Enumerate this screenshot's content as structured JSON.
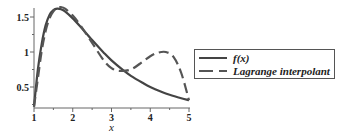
{
  "chart_data": {
    "type": "line",
    "title": "",
    "xlabel": "x",
    "ylabel": "",
    "xlim": [
      1,
      5
    ],
    "ylim": [
      0.21,
      1.7
    ],
    "xticks": [
      1,
      2,
      3,
      4,
      5
    ],
    "xtick_labels": [
      "1",
      "2",
      "3",
      "4",
      "5"
    ],
    "yticks": [
      0.5,
      1,
      1.5
    ],
    "ytick_labels": [
      "0.5",
      "1",
      "1.5"
    ],
    "grid": false,
    "legend_position": "right",
    "series": [
      {
        "name": "f(x)",
        "style": "solid",
        "color": "#444444",
        "x": [
          1.0,
          1.1,
          1.2,
          1.3,
          1.4,
          1.5,
          1.6,
          1.7,
          1.8,
          2.0,
          2.2,
          2.5,
          2.8,
          3.0,
          3.3,
          3.5,
          3.8,
          4.0,
          4.3,
          4.5,
          4.8,
          5.0
        ],
        "y": [
          0.22,
          0.75,
          1.12,
          1.38,
          1.53,
          1.6,
          1.62,
          1.61,
          1.58,
          1.48,
          1.36,
          1.17,
          0.99,
          0.88,
          0.74,
          0.66,
          0.56,
          0.5,
          0.43,
          0.39,
          0.34,
          0.31
        ]
      },
      {
        "name": "Lagrange interpolant",
        "style": "dashed",
        "color": "#555555",
        "x": [
          1.0,
          1.1,
          1.2,
          1.3,
          1.4,
          1.5,
          1.6,
          1.7,
          1.8,
          2.0,
          2.2,
          2.5,
          2.8,
          3.0,
          3.2,
          3.5,
          3.8,
          4.0,
          4.2,
          4.4,
          4.6,
          4.8,
          5.0
        ],
        "y": [
          0.22,
          0.62,
          1.02,
          1.3,
          1.48,
          1.58,
          1.63,
          1.64,
          1.62,
          1.52,
          1.38,
          1.13,
          0.88,
          0.77,
          0.73,
          0.75,
          0.86,
          0.94,
          0.99,
          1.0,
          0.93,
          0.7,
          0.31
        ]
      }
    ]
  },
  "legend": {
    "items": [
      {
        "label": "f(x)",
        "style": "solid"
      },
      {
        "label": "Lagrange interpolant",
        "style": "dashed"
      }
    ]
  }
}
